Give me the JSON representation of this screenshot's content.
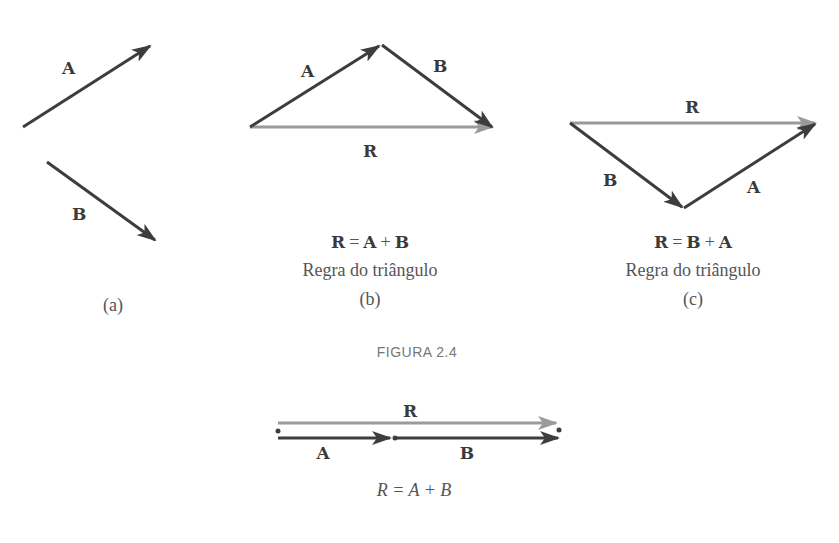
{
  "figure_title": "FIGURA 2.4",
  "colors": {
    "vector_dark": "#3d3d3d",
    "vector_resultant": "#9a9a9a",
    "text": "#555555"
  },
  "panels": {
    "a": {
      "caption": "(a)",
      "labels": {
        "A": "A",
        "B": "B"
      }
    },
    "b": {
      "equation": {
        "lhs": "R",
        "eq": "=",
        "t1": "A",
        "plus": "+",
        "t2": "B"
      },
      "rule": "Regra do triângulo",
      "caption": "(b)",
      "labels": {
        "A": "A",
        "B": "B",
        "R": "R"
      }
    },
    "c": {
      "equation": {
        "lhs": "R",
        "eq": "=",
        "t1": "B",
        "plus": "+",
        "t2": "A"
      },
      "rule": "Regra do triângulo",
      "caption": "(c)",
      "labels": {
        "A": "A",
        "B": "B",
        "R": "R"
      }
    }
  },
  "collinear": {
    "labels": {
      "A": "A",
      "B": "B",
      "R": "R"
    },
    "equation": "R = A + B"
  }
}
